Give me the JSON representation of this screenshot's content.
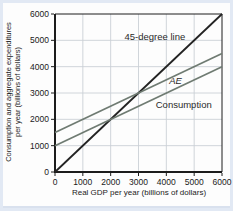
{
  "chart_data": {
    "type": "line",
    "title": "",
    "xlabel": "Real GDP per year (billions of dollars)",
    "ylabel": "Consumption and aggregate expenditures per year (billions of dollars)",
    "ylabel_lines": [
      "Consumption and aggregate expenditures",
      "per year (billions of dollars)"
    ],
    "xlim": [
      0,
      6000
    ],
    "ylim": [
      0,
      6000
    ],
    "xticks": [
      0,
      1000,
      2000,
      3000,
      4000,
      5000,
      6000
    ],
    "yticks": [
      0,
      1000,
      2000,
      3000,
      4000,
      5000,
      6000
    ],
    "grid": true,
    "legend_position": "inline-labels",
    "colors": {
      "grid": "#cbd0d6",
      "axis": "#1c1c1c",
      "line_gray_green": "#6f7b72",
      "line_black": "#232323",
      "label_text": "#2a2a2a",
      "frame": "#e2e9f4",
      "panel": "#fdfdfd"
    },
    "series": [
      {
        "name": "45-degree line",
        "x": [
          0,
          6000
        ],
        "y": [
          0,
          6000
        ],
        "color": "#232323",
        "width": 1.8,
        "label": {
          "text": "45-degree line",
          "x": 4680,
          "y": 5010,
          "anchor": "end",
          "style": "normal"
        }
      },
      {
        "name": "AE",
        "x": [
          0,
          6000
        ],
        "y": [
          1500,
          4500
        ],
        "color": "#6f7b72",
        "width": 1.7,
        "label": {
          "text": "AE",
          "x": 4330,
          "y": 3330,
          "anchor": "middle",
          "style": "italic"
        }
      },
      {
        "name": "Consumption",
        "x": [
          0,
          6000
        ],
        "y": [
          1000,
          4000
        ],
        "color": "#6f7b72",
        "width": 1.7,
        "label": {
          "text": "Consumption",
          "x": 3620,
          "y": 2430,
          "anchor": "start",
          "style": "normal"
        }
      }
    ]
  }
}
